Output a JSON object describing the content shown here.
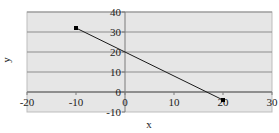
{
  "chart_data": {
    "type": "line",
    "title": "",
    "xlabel": "x",
    "ylabel": "y",
    "xlim": [
      -20,
      30
    ],
    "ylim": [
      -10,
      40
    ],
    "xticks": [
      -20,
      -10,
      0,
      10,
      20,
      30
    ],
    "yticks": [
      -10,
      0,
      10,
      20,
      30,
      40
    ],
    "grid": {
      "horizontal": true,
      "vertical": false
    },
    "legend": null,
    "series": [
      {
        "name": "",
        "x": [
          -10,
          20
        ],
        "y": [
          32,
          -4
        ],
        "markers": true
      }
    ]
  },
  "style": {
    "plot_bg": "#e6e6e6",
    "grid_color": "#8c8c8c",
    "axis_color": "#7a7a7a",
    "line_color": "#1a1a1a",
    "marker_color": "#000000"
  }
}
